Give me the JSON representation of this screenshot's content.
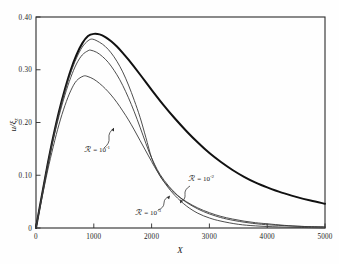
{
  "figure": {
    "background_color": "#fefefe",
    "frame_color": "#2b2b2b",
    "axis_origin_label": "0"
  },
  "chart_data": {
    "type": "line",
    "title": "",
    "subtitle": "",
    "xlabel": "X",
    "ylabel": "u/ξ₂",
    "xlim": [
      0,
      5000
    ],
    "ylim": [
      0,
      0.4
    ],
    "xticks": [
      0,
      1000,
      2000,
      3000,
      4000,
      5000
    ],
    "xtick_labels": [
      "0",
      "1000",
      "2000",
      "3000",
      "4000",
      "5000"
    ],
    "yticks": [
      0,
      0.1,
      0.2,
      0.3,
      0.4
    ],
    "ytick_labels": [
      "0",
      "0.10",
      "0.20",
      "0.30",
      "0.40"
    ],
    "grid": false,
    "legend_position": "inline-annotations",
    "annotations": [
      {
        "id": "ann-r-1e-1",
        "symbol": "ℛ",
        "equals": "=",
        "mantissa": "10",
        "exponent": "-1",
        "text": "ℛ = 10⁻¹",
        "label_x": 84,
        "label_y": 152,
        "arrow_from_x": 104,
        "arrow_from_y": 148,
        "arrow_to_x": 114,
        "arrow_to_y": 128
      },
      {
        "id": "ann-r-1e-2",
        "symbol": "ℛ",
        "equals": "=",
        "mantissa": "10",
        "exponent": "-2",
        "text": "ℛ = 10⁻²",
        "label_x": 188,
        "label_y": 181,
        "arrow_from_x": 190,
        "arrow_from_y": 186,
        "arrow_to_x": 180,
        "arrow_to_y": 203
      },
      {
        "id": "ann-r-1e-3",
        "symbol": "ℛ",
        "equals": "=",
        "mantissa": "10",
        "exponent": "-3",
        "text": "ℛ = 10⁻³",
        "label_x": 135,
        "label_y": 215,
        "arrow_from_x": 158,
        "arrow_from_y": 210,
        "arrow_to_x": 170,
        "arrow_to_y": 196
      }
    ],
    "series": [
      {
        "name": "ℛ = 0 (limiting curve)",
        "id": "curve-bold",
        "style": "bold",
        "line_width": 2.0,
        "color": "#111111",
        "peak_x": 1000,
        "peak_y": 0.368,
        "x": [
          0,
          100,
          200,
          300,
          400,
          500,
          600,
          700,
          800,
          900,
          1000,
          1100,
          1200,
          1300,
          1400,
          1500,
          1600,
          1800,
          2000,
          2200,
          2400,
          2600,
          2800,
          3000,
          3200,
          3400,
          3600,
          3800,
          4000,
          4250,
          4500,
          4750,
          5000
        ],
        "y": [
          0.0,
          0.061,
          0.12,
          0.174,
          0.222,
          0.263,
          0.299,
          0.328,
          0.35,
          0.364,
          0.368,
          0.367,
          0.362,
          0.354,
          0.344,
          0.332,
          0.319,
          0.291,
          0.262,
          0.234,
          0.208,
          0.184,
          0.162,
          0.142,
          0.125,
          0.11,
          0.097,
          0.086,
          0.077,
          0.067,
          0.059,
          0.052,
          0.046
        ]
      },
      {
        "name": "ℛ = 10⁻³",
        "id": "curve-r3",
        "style": "thin",
        "line_width": 0.9,
        "color": "#3a3a3a",
        "peak_x": 980,
        "peak_y": 0.358,
        "x": [
          0,
          100,
          200,
          300,
          400,
          500,
          600,
          700,
          800,
          900,
          980,
          1100,
          1200,
          1300,
          1400,
          1500,
          1600,
          1700,
          1800,
          1900,
          2000,
          2100,
          2200,
          2400,
          2600,
          2800,
          3000,
          3200,
          3400,
          3600,
          3800,
          4000,
          4300,
          4600,
          5000
        ],
        "y": [
          0.0,
          0.06,
          0.119,
          0.172,
          0.219,
          0.259,
          0.294,
          0.322,
          0.343,
          0.355,
          0.358,
          0.352,
          0.344,
          0.332,
          0.316,
          0.296,
          0.271,
          0.242,
          0.21,
          0.172,
          0.133,
          0.108,
          0.09,
          0.066,
          0.05,
          0.038,
          0.029,
          0.022,
          0.017,
          0.013,
          0.01,
          0.008,
          0.005,
          0.003,
          0.002
        ]
      },
      {
        "name": "ℛ = 10⁻²",
        "id": "curve-r2",
        "style": "thin",
        "line_width": 0.9,
        "color": "#3a3a3a",
        "peak_x": 950,
        "peak_y": 0.337,
        "x": [
          0,
          100,
          200,
          300,
          400,
          500,
          600,
          700,
          800,
          900,
          950,
          1050,
          1150,
          1250,
          1350,
          1450,
          1550,
          1650,
          1750,
          1850,
          1950,
          2050,
          2150,
          2300,
          2500,
          2700,
          2900,
          3100,
          3300,
          3600,
          3900,
          4200,
          4600,
          5000
        ],
        "y": [
          0.0,
          0.059,
          0.116,
          0.168,
          0.213,
          0.252,
          0.285,
          0.311,
          0.328,
          0.336,
          0.337,
          0.333,
          0.325,
          0.314,
          0.299,
          0.281,
          0.259,
          0.234,
          0.206,
          0.176,
          0.146,
          0.121,
          0.101,
          0.079,
          0.057,
          0.042,
          0.031,
          0.023,
          0.017,
          0.011,
          0.007,
          0.005,
          0.003,
          0.002
        ]
      },
      {
        "name": "ℛ = 10⁻¹",
        "id": "curve-r1",
        "style": "thin",
        "line_width": 0.9,
        "color": "#3a3a3a",
        "peak_x": 820,
        "peak_y": 0.288,
        "x": [
          0,
          100,
          200,
          300,
          400,
          500,
          600,
          700,
          820,
          900,
          1000,
          1100,
          1200,
          1300,
          1400,
          1500,
          1600,
          1700,
          1800,
          1900,
          2000,
          2100,
          2250,
          2400,
          2600,
          2800,
          3000,
          3200,
          3500,
          3800,
          4200,
          4600,
          5000
        ],
        "y": [
          0.0,
          0.055,
          0.108,
          0.155,
          0.197,
          0.232,
          0.26,
          0.279,
          0.288,
          0.287,
          0.282,
          0.274,
          0.264,
          0.252,
          0.238,
          0.222,
          0.205,
          0.186,
          0.166,
          0.146,
          0.126,
          0.107,
          0.082,
          0.062,
          0.042,
          0.028,
          0.019,
          0.013,
          0.007,
          0.004,
          0.002,
          0.001,
          0.0
        ]
      }
    ]
  }
}
